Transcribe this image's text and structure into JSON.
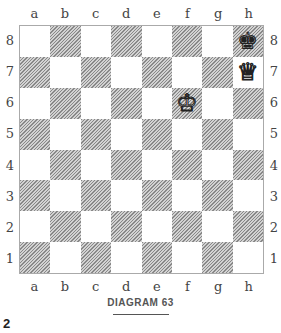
{
  "files": [
    "a",
    "b",
    "c",
    "d",
    "e",
    "f",
    "g",
    "h"
  ],
  "ranks": [
    "8",
    "7",
    "6",
    "5",
    "4",
    "3",
    "2",
    "1"
  ],
  "pieces": [
    {
      "square": "h8",
      "color": "black",
      "type": "king",
      "glyph": "♚",
      "icon": "black-king-icon"
    },
    {
      "square": "h7",
      "color": "white",
      "type": "queen",
      "glyph": "♕",
      "icon": "white-queen-icon"
    },
    {
      "square": "f6",
      "color": "white",
      "type": "king",
      "glyph": "♔",
      "icon": "white-king-icon"
    }
  ],
  "caption": "DIAGRAM 63",
  "page_number": "2",
  "colors": {
    "dark_square_hatch": "#888888",
    "light_square": "#ffffff",
    "border": "#aaaaaa"
  }
}
